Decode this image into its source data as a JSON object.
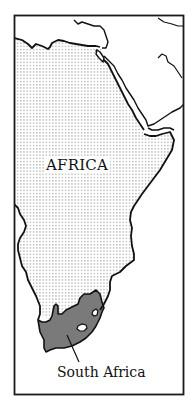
{
  "map": {
    "continent_label": "AFRICA",
    "highlighted_country_label": "South Africa",
    "colors": {
      "frame": "#1a1a1a",
      "coastline": "#111111",
      "highlight_fill": "#7a7a7a",
      "dot_pattern": "#8a8a8a",
      "background": "#ffffff"
    }
  }
}
